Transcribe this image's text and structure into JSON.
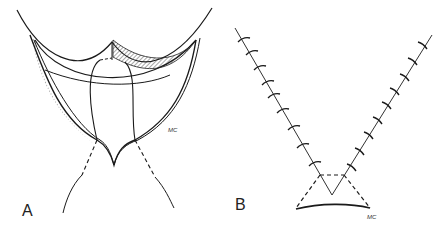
{
  "figure": {
    "panels": [
      {
        "id": "A",
        "label": "A",
        "signature": "MC",
        "description": "V-shaped skin flap incision with hatched undermined areas"
      },
      {
        "id": "B",
        "label": "B",
        "signature": "MC",
        "description": "V-shaped sutured closure with interrupted stitches and dashed triangle"
      }
    ],
    "stroke_color": "#1a1a1a"
  }
}
